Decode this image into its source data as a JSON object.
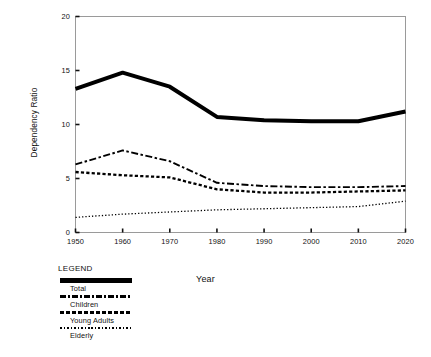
{
  "chart_data": {
    "type": "line",
    "title": "",
    "xlabel": "Year",
    "ylabel": "Dependency Ratio",
    "x": [
      1950,
      1960,
      1970,
      1980,
      1990,
      2000,
      2010,
      2020
    ],
    "xtick_labels": [
      "1950",
      "1960",
      "1970",
      "1980",
      "1990",
      "2000",
      "2010",
      "2020"
    ],
    "ytick_labels": [
      "0",
      "5",
      "10",
      "15",
      "20"
    ],
    "yticks": [
      0,
      5,
      10,
      15,
      20
    ],
    "ylim": [
      0,
      20
    ],
    "xlim": [
      1950,
      2020
    ],
    "grid": false,
    "legend_position": "below-left",
    "legend_title": "LEGEND",
    "series": [
      {
        "name": "Total",
        "style": "solid-thick",
        "color": "#000000",
        "values": [
          13.3,
          14.8,
          13.5,
          10.7,
          10.4,
          10.3,
          10.3,
          11.2
        ]
      },
      {
        "name": "Children",
        "style": "dash-dot",
        "color": "#000000",
        "values": [
          6.3,
          7.6,
          6.6,
          4.6,
          4.3,
          4.2,
          4.2,
          4.3
        ]
      },
      {
        "name": "Young Adults",
        "style": "dotted-thick",
        "color": "#000000",
        "values": [
          5.6,
          5.3,
          5.1,
          4.0,
          3.7,
          3.7,
          3.8,
          3.9
        ]
      },
      {
        "name": "Elderly",
        "style": "dotted-fine",
        "color": "#000000",
        "values": [
          1.4,
          1.7,
          1.9,
          2.1,
          2.2,
          2.3,
          2.4,
          2.9
        ]
      }
    ]
  },
  "axes": {
    "y_title": "Dependency Ratio",
    "x_title": "Year",
    "frame_color": "#9a9a9a"
  },
  "legend": {
    "title": "LEGEND",
    "items": [
      {
        "label": "Total",
        "swatch": "solid-thick-swatch"
      },
      {
        "label": "Children",
        "swatch": "dash-dot-swatch"
      },
      {
        "label": "Young Adults",
        "swatch": "dotted-thick-swatch"
      },
      {
        "label": "Elderly",
        "swatch": "dotted-fine-swatch"
      }
    ]
  }
}
